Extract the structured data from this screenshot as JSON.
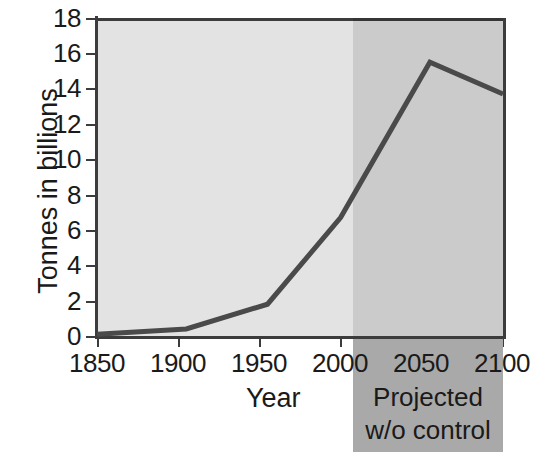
{
  "chart_data": {
    "type": "line",
    "title": "",
    "xlabel": "Year",
    "ylabel": "Tonnes in billions",
    "xlim": [
      1850,
      2100
    ],
    "ylim": [
      0,
      18
    ],
    "grid": false,
    "legend": "none",
    "x_ticks": [
      "1850",
      "1900",
      "1950",
      "2000",
      "2050",
      "2100"
    ],
    "y_ticks": [
      "0",
      "2",
      "4",
      "6",
      "8",
      "10",
      "12",
      "14",
      "16",
      "18"
    ],
    "series": [
      {
        "name": "Carbon emissions",
        "x": [
          1850,
          1905,
          1955,
          2000,
          2055,
          2100
        ],
        "values": [
          0.1,
          0.4,
          1.8,
          6.7,
          15.5,
          13.7
        ]
      }
    ],
    "annotations": [
      {
        "name": "projection-region",
        "text_line1": "Projected",
        "text_line2": "w/o control",
        "x_start": 2000,
        "x_end": 2100
      }
    ],
    "colors": {
      "plot_background": "#e3e3e3",
      "projection_background": "#a9a9a9",
      "line": "#4a4a4a",
      "axis": "#3c3c3c",
      "text": "#1a1a1a"
    }
  },
  "axis": {
    "y_title": "Tonnes in billions",
    "x_title": "Year",
    "y_ticks": [
      {
        "label": "18",
        "value": 18
      },
      {
        "label": "16",
        "value": 16
      },
      {
        "label": "14",
        "value": 14
      },
      {
        "label": "12",
        "value": 12
      },
      {
        "label": "10",
        "value": 10
      },
      {
        "label": "8",
        "value": 8
      },
      {
        "label": "6",
        "value": 6
      },
      {
        "label": "4",
        "value": 4
      },
      {
        "label": "2",
        "value": 2
      },
      {
        "label": "0",
        "value": 0
      }
    ],
    "x_ticks": [
      {
        "label": "1850",
        "value": 1850
      },
      {
        "label": "1900",
        "value": 1900
      },
      {
        "label": "1950",
        "value": 1950
      },
      {
        "label": "2000",
        "value": 2000
      },
      {
        "label": "2050",
        "value": 2050
      },
      {
        "label": "2100",
        "value": 2100
      }
    ]
  },
  "projection": {
    "line1": "Projected",
    "line2": "w/o control"
  }
}
